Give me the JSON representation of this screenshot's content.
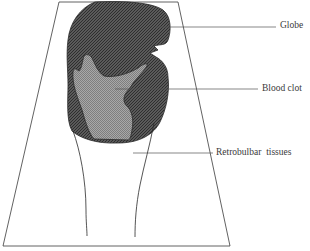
{
  "diagram": {
    "type": "anatomical-schematic",
    "labels": {
      "globe": "Globe",
      "blood_clot": "Blood clot",
      "retrobulbar_tissues": "Retrobulbar  tissues"
    },
    "colors": {
      "globe_fill": "#4a4a4a",
      "clot_fill": "#9a9a9a",
      "outline": "#2a2a2a",
      "leader_line": "#555555",
      "background": "#ffffff"
    }
  }
}
